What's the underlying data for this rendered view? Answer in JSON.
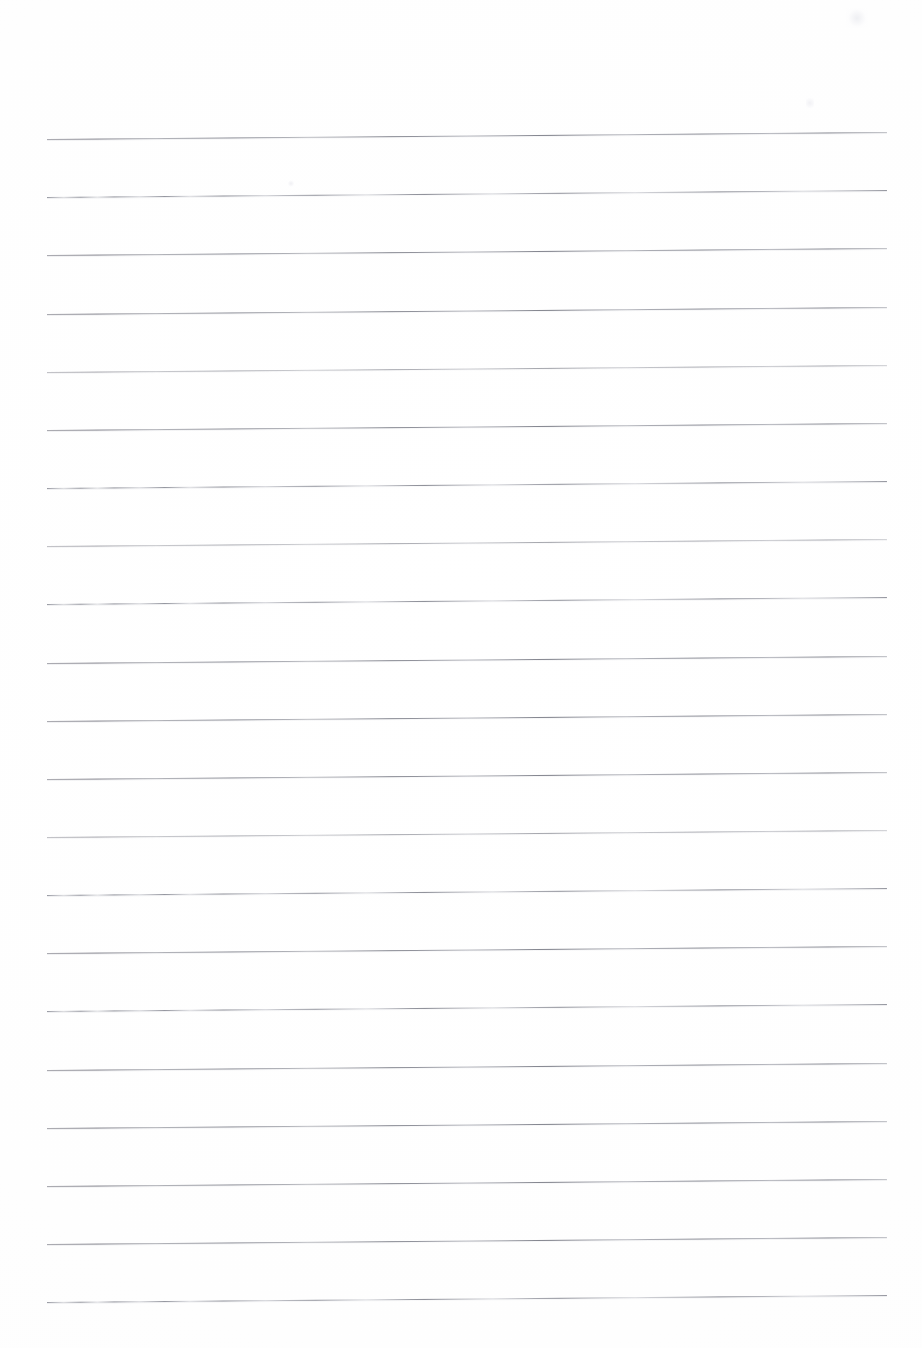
{
  "document": {
    "kind": "scanned-lined-notebook-page",
    "title": "",
    "visible_text": "",
    "body_text": "",
    "page_number": "",
    "header_text": "",
    "footer_text": ""
  },
  "colors": {
    "page_background": "#fefefe",
    "rule_line": "#8a8c96",
    "rule_line_light": "#b2b4bc"
  },
  "page": {
    "width": 922,
    "height": 1348
  },
  "ruling": {
    "line_count": 21,
    "line_start_x": 47,
    "line_end_x": 887,
    "line_length": 840,
    "first_line_y": 139,
    "line_spacing": 58.15,
    "skew_px": -7,
    "skew_deg": -0.477,
    "thickness": 1,
    "lines": [
      {
        "index": 1,
        "y": 139,
        "weight": "strong",
        "texture": "solid"
      },
      {
        "index": 2,
        "y": 197,
        "weight": "strong",
        "texture": "dotty"
      },
      {
        "index": 3,
        "y": 255,
        "weight": "strong",
        "texture": "solid"
      },
      {
        "index": 4,
        "y": 314,
        "weight": "strong",
        "texture": "solid"
      },
      {
        "index": 5,
        "y": 372,
        "weight": "faint",
        "texture": "solid"
      },
      {
        "index": 6,
        "y": 430,
        "weight": "strong",
        "texture": "solid"
      },
      {
        "index": 7,
        "y": 488,
        "weight": "strong",
        "texture": "dotty"
      },
      {
        "index": 8,
        "y": 546,
        "weight": "faint",
        "texture": "solid"
      },
      {
        "index": 9,
        "y": 604,
        "weight": "strong",
        "texture": "dotty"
      },
      {
        "index": 10,
        "y": 663,
        "weight": "strong",
        "texture": "solid"
      },
      {
        "index": 11,
        "y": 721,
        "weight": "strong",
        "texture": "solid"
      },
      {
        "index": 12,
        "y": 779,
        "weight": "strong",
        "texture": "solid"
      },
      {
        "index": 13,
        "y": 837,
        "weight": "faint",
        "texture": "solid"
      },
      {
        "index": 14,
        "y": 895,
        "weight": "strong",
        "texture": "dotty"
      },
      {
        "index": 15,
        "y": 953,
        "weight": "strong",
        "texture": "solid"
      },
      {
        "index": 16,
        "y": 1011,
        "weight": "strong",
        "texture": "dotty"
      },
      {
        "index": 17,
        "y": 1070,
        "weight": "strong",
        "texture": "solid"
      },
      {
        "index": 18,
        "y": 1128,
        "weight": "strong",
        "texture": "solid"
      },
      {
        "index": 19,
        "y": 1186,
        "weight": "strong",
        "texture": "solid"
      },
      {
        "index": 20,
        "y": 1244,
        "weight": "strong",
        "texture": "solid"
      },
      {
        "index": 21,
        "y": 1302,
        "weight": "strong",
        "texture": "dotty"
      }
    ]
  },
  "margins": {
    "top_blank_px": 139,
    "left_blank_px": 47,
    "right_blank_px": 35,
    "bottom_blank_px": 46
  }
}
